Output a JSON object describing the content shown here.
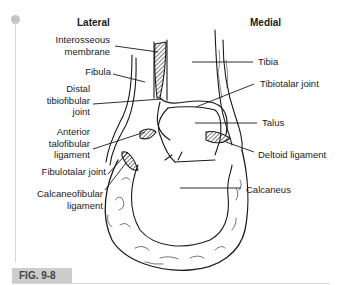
{
  "figure": {
    "caption": "FIG. 9-8",
    "headings": {
      "lateral": "Lateral",
      "medial": "Medial"
    },
    "left_labels": [
      {
        "lines": [
          "Interosseous",
          "membrane"
        ]
      },
      {
        "lines": [
          "Fibula"
        ]
      },
      {
        "lines": [
          "Distal",
          "tibiofibular",
          "joint"
        ]
      },
      {
        "lines": [
          "Anterior",
          "talofibular",
          "ligament"
        ]
      },
      {
        "lines": [
          "Fibulotalar joint"
        ]
      },
      {
        "lines": [
          "Calcaneofibular",
          "ligament"
        ]
      }
    ],
    "right_labels": [
      {
        "lines": [
          "Tibia"
        ]
      },
      {
        "lines": [
          "Tibiotalar joint"
        ]
      },
      {
        "lines": [
          "Talus"
        ]
      },
      {
        "lines": [
          "Deltoid ligament"
        ]
      },
      {
        "lines": [
          "Calcaneus"
        ]
      }
    ],
    "colors": {
      "caption_bg": "#cdcdcd",
      "margin_accent": "#c4c4c4",
      "line": "#1a1a1a"
    }
  }
}
